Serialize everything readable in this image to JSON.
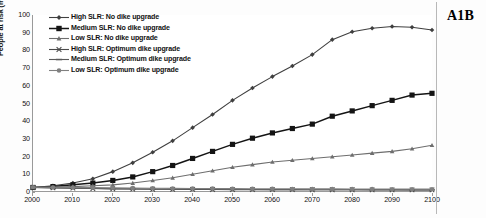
{
  "panel": {
    "label": "A1B"
  },
  "axes": {
    "ylabel": "People at risk (millions per year)",
    "xlabel": "",
    "yticks": [
      0,
      10,
      20,
      30,
      40,
      50,
      60,
      70,
      80,
      90,
      100
    ],
    "xticks": [
      2000,
      2010,
      2020,
      2030,
      2040,
      2050,
      2060,
      2070,
      2080,
      2090,
      2100
    ]
  },
  "legend": {
    "position": "upper-left",
    "entries": [
      {
        "label": "High SLR: No dike upgrade",
        "marker": "diamond",
        "color": "#3f3f3f"
      },
      {
        "label": "Medium SLR: No dike upgrade",
        "marker": "square",
        "color": "#141414"
      },
      {
        "label": "Low SLR: No dike upgrade",
        "marker": "triangle",
        "color": "#6e6e6e"
      },
      {
        "label": "High SLR: Optimum dike upgrade",
        "marker": "cross",
        "color": "#4a4a4a"
      },
      {
        "label": "Medium SLR:  Optimum dike upgrade",
        "marker": "dash",
        "color": "#5a5a5a"
      },
      {
        "label": "Low SLR: Optimum dike upgrade",
        "marker": "circle",
        "color": "#808080"
      }
    ]
  },
  "chart_data": {
    "type": "line",
    "title": "",
    "subtitle": "",
    "xlabel": "",
    "ylabel": "People at risk (millions per year)",
    "xlim": [
      2000,
      2100
    ],
    "ylim": [
      0,
      100
    ],
    "grid": false,
    "legend_position": "upper-left",
    "annotations": [
      "A1B"
    ],
    "x": [
      2000,
      2005,
      2010,
      2015,
      2020,
      2025,
      2030,
      2035,
      2040,
      2045,
      2050,
      2055,
      2060,
      2065,
      2070,
      2075,
      2080,
      2085,
      2090,
      2095,
      2100
    ],
    "series": [
      {
        "name": "High SLR: No dike upgrade",
        "marker": "diamond",
        "color": "#3f3f3f",
        "values": [
          2.0,
          3.0,
          4.5,
          7.0,
          11.0,
          16.0,
          22.0,
          28.5,
          36.0,
          43.5,
          51.5,
          58.5,
          65.0,
          71.0,
          77.5,
          86.0,
          90.5,
          92.5,
          93.5,
          93.0,
          91.5
        ]
      },
      {
        "name": "Medium SLR: No dike upgrade",
        "marker": "square",
        "color": "#141414",
        "values": [
          2.0,
          2.5,
          3.5,
          4.5,
          6.0,
          8.0,
          11.0,
          14.5,
          18.5,
          22.5,
          26.5,
          30.0,
          33.0,
          35.5,
          38.0,
          42.5,
          45.5,
          48.5,
          51.5,
          54.5,
          55.5
        ]
      },
      {
        "name": "Low SLR: No dike upgrade",
        "marker": "triangle",
        "color": "#6e6e6e",
        "values": [
          2.0,
          2.2,
          2.5,
          3.0,
          3.5,
          4.5,
          6.0,
          7.5,
          9.5,
          11.5,
          13.5,
          15.0,
          16.5,
          17.5,
          18.5,
          19.5,
          20.5,
          21.5,
          22.5,
          24.0,
          26.0
        ]
      },
      {
        "name": "High SLR: Optimum dike upgrade",
        "marker": "cross",
        "color": "#4a4a4a",
        "values": [
          2.0,
          1.8,
          1.6,
          1.4,
          1.2,
          1.1,
          1.0,
          0.95,
          0.9,
          0.85,
          0.8,
          0.8,
          0.75,
          0.75,
          0.7,
          0.7,
          0.7,
          0.65,
          0.65,
          0.6,
          0.6
        ]
      },
      {
        "name": "Medium SLR:  Optimum dike upgrade",
        "marker": "dash",
        "color": "#5a5a5a",
        "values": [
          2.0,
          1.9,
          1.7,
          1.5,
          1.3,
          1.2,
          1.1,
          1.0,
          0.95,
          0.9,
          0.9,
          0.85,
          0.8,
          0.8,
          0.75,
          0.75,
          0.7,
          0.7,
          0.7,
          0.65,
          0.65
        ]
      },
      {
        "name": "Low SLR: Optimum dike upgrade",
        "marker": "circle",
        "color": "#808080",
        "values": [
          2.2,
          2.1,
          2.0,
          1.9,
          1.8,
          1.7,
          1.6,
          1.5,
          1.45,
          1.4,
          1.35,
          1.3,
          1.3,
          1.25,
          1.2,
          1.2,
          1.15,
          1.15,
          1.1,
          1.1,
          1.05
        ]
      }
    ]
  }
}
